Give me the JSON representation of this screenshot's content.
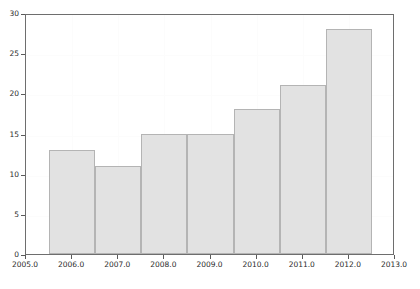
{
  "chart_data": {
    "type": "bar",
    "title": "",
    "subtitle": "",
    "xlabel": "",
    "ylabel": "",
    "categories": [
      2006,
      2007,
      2008,
      2009,
      2010,
      2011,
      2012
    ],
    "values": [
      13,
      11,
      15,
      15,
      18,
      21,
      28
    ],
    "series": [
      {
        "name": "count",
        "values": [
          13,
          11,
          15,
          15,
          18,
          21,
          28
        ]
      }
    ],
    "bar_spans": [
      [
        2005.5,
        2006.5
      ],
      [
        2006.5,
        2007.5
      ],
      [
        2007.5,
        2008.5
      ],
      [
        2008.5,
        2009.5
      ],
      [
        2009.5,
        2010.5
      ],
      [
        2010.5,
        2011.5
      ],
      [
        2011.5,
        2012.5
      ]
    ],
    "xlim": [
      2005.0,
      2013.0
    ],
    "ylim": [
      0,
      30
    ],
    "xticks": [
      2005.0,
      2006.0,
      2007.0,
      2008.0,
      2009.0,
      2010.0,
      2011.0,
      2012.0,
      2013.0
    ],
    "xtick_labels": [
      "2005.0",
      "2006.0",
      "2007.0",
      "2008.0",
      "2009.0",
      "2010.0",
      "2011.0",
      "2012.0",
      "2013.0"
    ],
    "yticks": [
      0,
      5,
      10,
      15,
      20,
      25,
      30
    ],
    "ytick_labels": [
      "0",
      "5",
      "10",
      "15",
      "20",
      "25",
      "30"
    ],
    "grid": true,
    "legend": false,
    "legend_position": "none",
    "annotations": []
  },
  "style": {
    "bar_fill": "#e2e2e2",
    "bar_edge": "#b4b4b4",
    "axis_color": "#6e6e6e",
    "tick_color": "#5a5a5a",
    "text_color": "#2b2b2b",
    "grid_color": "#fcfcfc",
    "background": "#ffffff"
  },
  "caption": {
    "text": "",
    "visible": false
  }
}
